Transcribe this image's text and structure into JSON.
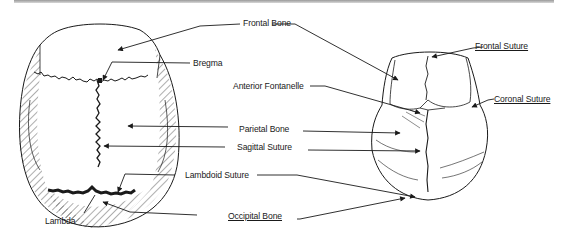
{
  "figure": {
    "views": [
      "left-skull-schematic",
      "right-skull-sketch"
    ],
    "line_color": "#1a1a1a",
    "hatch_color": "#333333"
  },
  "labels": {
    "frontal_bone": "Frontal Bone",
    "bregma": "Bregma",
    "anterior_fontanelle": "Anterior Fontanelle",
    "parietal_bone": "Parietal Bone",
    "sagittal_suture": "Sagittal Suture",
    "lambdoid_suture": "Lambdoid Suture",
    "lambda": "Lambda",
    "occipital_bone": "Occipital Bone",
    "frontal_suture": "Frontal Suture",
    "coronal_suture": "Coronal Suture"
  }
}
